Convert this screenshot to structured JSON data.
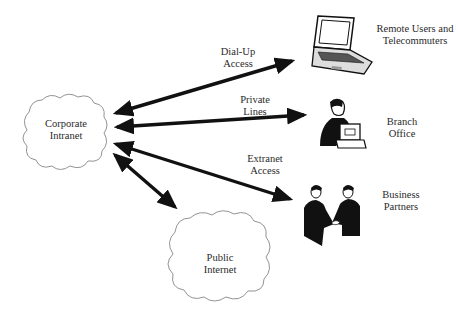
{
  "diagram": {
    "nodes": [
      {
        "id": "corporate",
        "shape": "cloud",
        "line1": "Corporate",
        "line2": "Intranet"
      },
      {
        "id": "public",
        "shape": "cloud",
        "line1": "Public",
        "line2": "Internet"
      },
      {
        "id": "remote",
        "icon": "laptop-icon",
        "line1": "Remote Users and",
        "line2": "Telecommuters"
      },
      {
        "id": "branch",
        "icon": "office-worker-icon",
        "line1": "Branch",
        "line2": "Office"
      },
      {
        "id": "partners",
        "icon": "handshake-icon",
        "line1": "Business",
        "line2": "Partners"
      }
    ],
    "edges": [
      {
        "from": "corporate",
        "to": "remote",
        "line1": "Dial-Up",
        "line2": "Access",
        "bidirectional": true
      },
      {
        "from": "corporate",
        "to": "branch",
        "line1": "Private",
        "line2": "Lines",
        "bidirectional": true
      },
      {
        "from": "corporate",
        "to": "partners",
        "line1": "Extranet",
        "line2": "Access",
        "bidirectional": true
      },
      {
        "from": "corporate",
        "to": "public",
        "line1": "",
        "line2": "",
        "bidirectional": true
      }
    ],
    "colors": {
      "arrow": "#111111",
      "cloud_stroke": "#777777",
      "text": "#2a2a2a"
    }
  }
}
